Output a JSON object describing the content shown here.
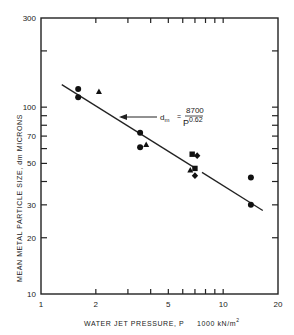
{
  "chart_data": {
    "type": "scatter",
    "title": "",
    "xlabel": "WATER JET PRESSURE, P",
    "xlabel_units": "1000 kN/m",
    "xlabel_units_sup": "2",
    "ylabel": "MEAN METAL PARTICLE SIZE, dm MICRONS",
    "xscale": "log",
    "yscale": "log",
    "xlim": [
      1,
      20
    ],
    "ylim": [
      10,
      300
    ],
    "x_tick_labels": [
      "1",
      "2",
      "5",
      "10",
      "20"
    ],
    "x_tick_values": [
      1,
      2,
      5,
      10,
      20
    ],
    "x_minor_ticks": [
      3,
      4,
      6,
      7,
      8,
      9
    ],
    "y_tick_labels": [
      "10",
      "20",
      "30",
      "50",
      "70",
      "100",
      "300"
    ],
    "y_tick_values": [
      10,
      20,
      30,
      50,
      70,
      100,
      300
    ],
    "y_minor_ticks": [
      40,
      60,
      80,
      90,
      200
    ],
    "grid": false,
    "series": [
      {
        "name": "circles",
        "marker": "circle",
        "points": [
          [
            1.6,
            125
          ],
          [
            1.6,
            113
          ],
          [
            3.5,
            73
          ],
          [
            3.5,
            61
          ],
          [
            14.2,
            42
          ],
          [
            14.2,
            30
          ]
        ]
      },
      {
        "name": "triangles",
        "marker": "triangle",
        "points": [
          [
            2.08,
            121
          ],
          [
            3.78,
            63
          ],
          [
            6.6,
            46
          ]
        ]
      },
      {
        "name": "squares",
        "marker": "square",
        "points": [
          [
            6.76,
            56
          ],
          [
            7.0,
            47
          ]
        ]
      },
      {
        "name": "diamonds",
        "marker": "diamond",
        "points": [
          [
            7.2,
            55
          ],
          [
            7.0,
            43
          ]
        ]
      }
    ],
    "fit_line": {
      "equation_lhs": "d",
      "equation_lhs_sub": "m",
      "equation_eq": "=",
      "numerator": "8700",
      "denominator_base": "P",
      "denominator_exp": "0.62",
      "from": [
        1.3,
        132
      ],
      "to": [
        16.5,
        28
      ]
    }
  }
}
